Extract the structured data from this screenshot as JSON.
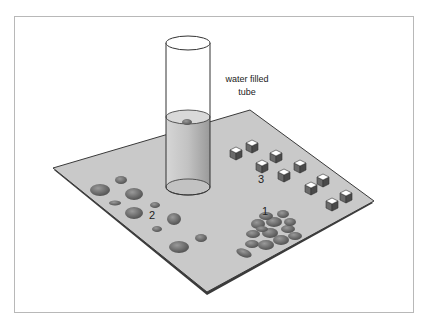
{
  "figure": {
    "tube_label_line1": "water filled",
    "tube_label_line2": "tube",
    "group_labels": [
      "1",
      "2",
      "3"
    ]
  },
  "colors": {
    "plate": "#c9c9c9",
    "plate_edge": "#3a3a3a",
    "pebble": "#6e6e6e",
    "cube_top": "#ffffff",
    "cube_side": "#5a5a5a",
    "tube_water": "#cfcfcf"
  }
}
